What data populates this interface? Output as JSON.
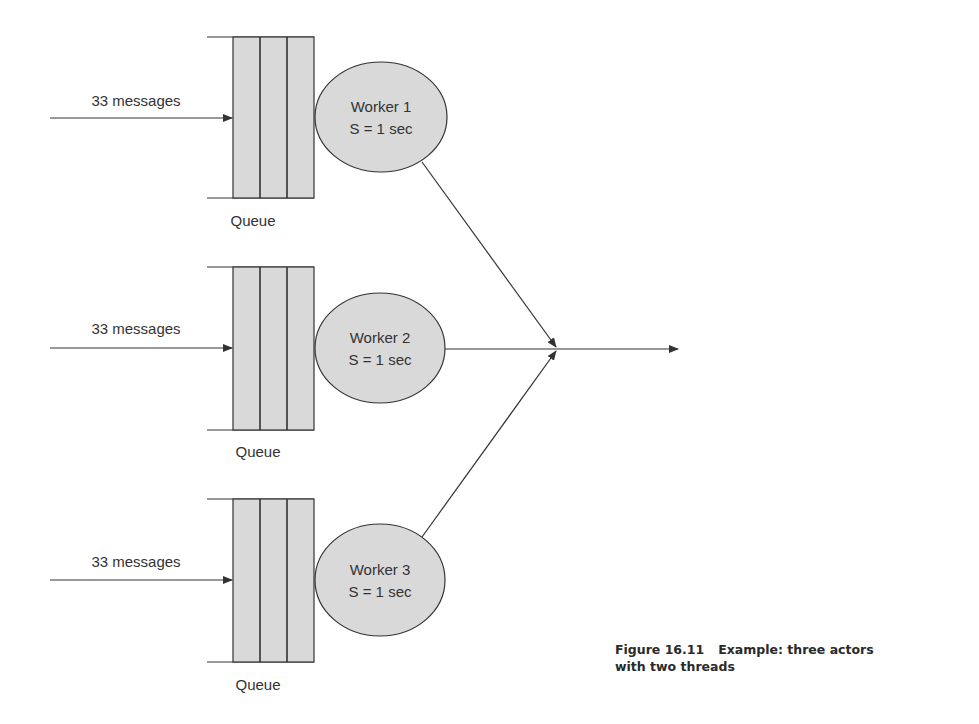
{
  "figure": {
    "caption_number": "Figure 16.11",
    "caption_line1": "Example: three actors",
    "caption_line2": "with two threads"
  },
  "colors": {
    "stroke": "#333333",
    "fill": "#d9d9d9",
    "text": "#333333"
  },
  "rows": [
    {
      "input_label": "33 messages",
      "queue_label": "Queue",
      "worker_name": "Worker 1",
      "service_time": "S = 1 sec"
    },
    {
      "input_label": "33 messages",
      "queue_label": "Queue",
      "worker_name": "Worker 2",
      "service_time": "S = 1 sec"
    },
    {
      "input_label": "33 messages",
      "queue_label": "Queue",
      "worker_name": "Worker 3",
      "service_time": "S = 1 sec"
    }
  ]
}
